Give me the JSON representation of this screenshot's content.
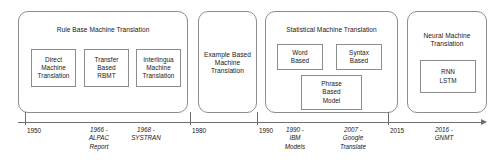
{
  "diagram": {
    "eras": [
      {
        "id": "rule-base",
        "title": "Rule Base Machine Translation",
        "techniques": [
          {
            "id": "direct-mt",
            "label": "Direct\nMachine\nTranslation"
          },
          {
            "id": "transfer-rbmt",
            "label": "Transfer\nBased\nRBMT"
          },
          {
            "id": "interlingua-mt",
            "label": "Interlingua\nMachine\nTranslation"
          }
        ]
      },
      {
        "id": "example-based",
        "title": "Example Based\nMachine\nTranslation",
        "techniques": []
      },
      {
        "id": "statistical",
        "title": "Statistical Machine Translation",
        "techniques": [
          {
            "id": "word-based",
            "label": "Word\nBased"
          },
          {
            "id": "syntax-based",
            "label": "Syntax\nBased"
          },
          {
            "id": "phrase-based-model",
            "label": "Phrase\nBased\nModel"
          }
        ]
      },
      {
        "id": "neural",
        "title": "Neural Machine\nTranslation",
        "techniques": [
          {
            "id": "rnn-lstm",
            "label": "RNN\nLSTM"
          }
        ]
      }
    ],
    "timeline": {
      "ticks": [
        {
          "id": "tick-1950",
          "label": "1950"
        },
        {
          "id": "tick-1980",
          "label": "1980"
        },
        {
          "id": "tick-1990",
          "label": "1990"
        },
        {
          "id": "tick-2015",
          "label": "2015"
        }
      ],
      "events": [
        {
          "id": "event-alpac",
          "label": "1966 -\nALPAC\nReport"
        },
        {
          "id": "event-systran",
          "label": "1968 -\nSYSTRAN"
        },
        {
          "id": "event-ibm",
          "label": "1990 -\nIBM\nModels"
        },
        {
          "id": "event-google-translate",
          "label": "2007 -\nGoogle\nTranslate"
        },
        {
          "id": "event-gnmt",
          "label": "2016 -\nGNMT"
        }
      ]
    },
    "colors": {
      "stroke": "#8d8d8d",
      "axis": "#6f6f6f",
      "text": "#171717",
      "background": "#ffffff"
    }
  }
}
